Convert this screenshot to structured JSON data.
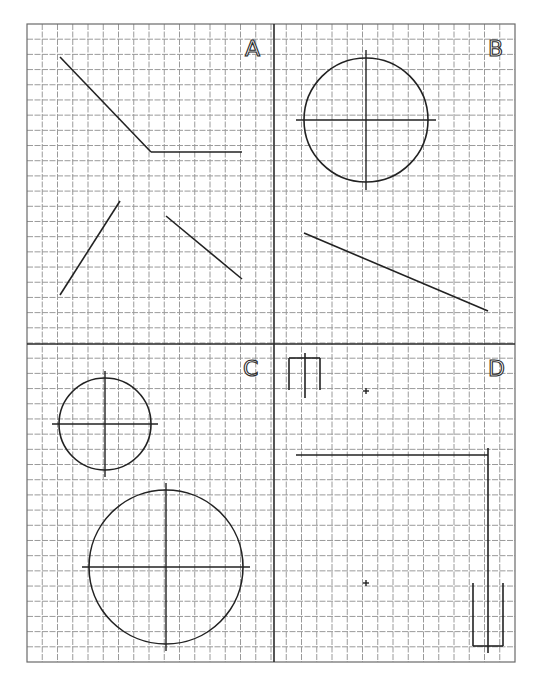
{
  "drawing": {
    "grid": {
      "x0": 27,
      "y0": 24,
      "x1": 515,
      "y1": 662,
      "cols": 32,
      "rows": 42,
      "line_color": "#9a9a9a"
    },
    "dividers": {
      "vertical_x": 274,
      "horizontal_y": 344
    },
    "quadrants": [
      {
        "id": "A",
        "label": "A",
        "label_pos": [
          245,
          56
        ],
        "lines": [
          [
            60,
            57,
            151,
            152
          ],
          [
            151,
            152,
            242,
            152
          ],
          [
            120,
            201,
            60,
            295
          ],
          [
            166,
            216,
            242,
            279
          ]
        ],
        "circles": [],
        "center_marks": []
      },
      {
        "id": "B",
        "label": "B",
        "label_pos": [
          488,
          56
        ],
        "lines": [
          [
            304,
            233,
            488,
            311
          ]
        ],
        "circles": [
          {
            "cx": 366,
            "cy": 120,
            "r": 62,
            "cross_ext": 8
          }
        ],
        "center_marks": []
      },
      {
        "id": "C",
        "label": "C",
        "label_pos": [
          243,
          376
        ],
        "lines": [],
        "circles": [
          {
            "cx": 105,
            "cy": 424,
            "r": 46,
            "cross_ext": 7
          },
          {
            "cx": 166,
            "cy": 567,
            "r": 77,
            "cross_ext": 7
          }
        ],
        "center_marks": []
      },
      {
        "id": "D",
        "label": "D",
        "label_pos": [
          488,
          376
        ],
        "lines": [
          [
            289,
            390,
            289,
            358
          ],
          [
            289,
            358,
            320,
            358
          ],
          [
            320,
            358,
            320,
            390
          ],
          [
            305,
            353,
            305,
            398
          ],
          [
            296,
            455,
            488,
            455
          ],
          [
            488,
            448,
            488,
            653
          ],
          [
            473,
            583,
            473,
            646
          ],
          [
            473,
            646,
            503,
            646
          ],
          [
            503,
            646,
            503,
            583
          ]
        ],
        "circles": [],
        "center_marks": [
          {
            "x": 366,
            "y": 391
          },
          {
            "x": 366,
            "y": 583
          }
        ]
      }
    ]
  }
}
